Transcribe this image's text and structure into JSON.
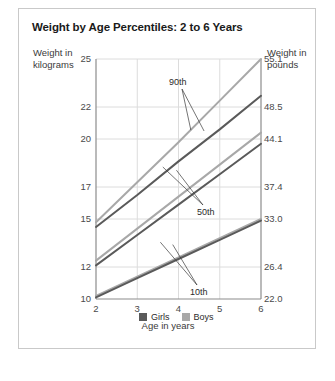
{
  "figure": {
    "title": "Weight by Age Percentiles: 2 to 6 Years",
    "y_left_title": "Weight in kilograms",
    "y_right_title": "Weight in pounds",
    "x_title": "Age in years",
    "border_color": "#c9c9c9",
    "grid_color": "#dcdcdc",
    "axis_color": "#8c8c8c"
  },
  "legend": {
    "items": [
      {
        "label": "Girls",
        "color": "#5a5a5a"
      },
      {
        "label": "Boys",
        "color": "#a8a8a8"
      }
    ]
  },
  "annotations": [
    {
      "name": "percentile-90-label",
      "text": "90th"
    },
    {
      "name": "percentile-50-label",
      "text": "50th"
    },
    {
      "name": "percentile-10-label",
      "text": "10th"
    }
  ],
  "chart_data": {
    "type": "line",
    "title": "Weight by Age Percentiles: 2 to 6 Years",
    "xlabel": "Age in years",
    "ylabel": "Weight in kilograms",
    "ylabel_right": "Weight in pounds",
    "grid": true,
    "legend_position": "bottom-center",
    "x": [
      2,
      3,
      4,
      5,
      6
    ],
    "xlim": [
      2,
      6
    ],
    "xticks": [
      "2",
      "3",
      "4",
      "5",
      "6"
    ],
    "ylim": [
      10,
      25
    ],
    "yticks_left": [
      "25",
      "22",
      "20",
      "17",
      "15",
      "12",
      "10"
    ],
    "yticks_left_values": [
      25,
      22,
      20,
      17,
      15,
      12,
      10
    ],
    "yticks_right": [
      "55.1",
      "48.5",
      "44.1",
      "37.4",
      "33.0",
      "26.4",
      "22.0"
    ],
    "yticks_right_values": [
      55.1,
      48.5,
      44.1,
      37.4,
      33.0,
      26.4,
      22.0
    ],
    "series": [
      {
        "name": "Boys 90th",
        "group": "Boys",
        "percentile": "90th",
        "color": "#a8a8a8",
        "values": [
          14.8,
          17.3,
          19.8,
          22.4,
          25.0
        ]
      },
      {
        "name": "Girls 90th",
        "group": "Girls",
        "percentile": "90th",
        "color": "#5a5a5a",
        "values": [
          14.5,
          16.5,
          18.6,
          20.6,
          22.7
        ]
      },
      {
        "name": "Boys 50th",
        "group": "Boys",
        "percentile": "50th",
        "color": "#a8a8a8",
        "values": [
          12.4,
          14.4,
          16.4,
          18.4,
          20.4
        ]
      },
      {
        "name": "Girls 50th",
        "group": "Girls",
        "percentile": "50th",
        "color": "#5a5a5a",
        "values": [
          12.1,
          14.0,
          15.9,
          17.8,
          19.7
        ]
      },
      {
        "name": "Boys 10th",
        "group": "Boys",
        "percentile": "10th",
        "color": "#a8a8a8",
        "values": [
          10.2,
          11.4,
          12.6,
          13.8,
          15.0
        ]
      },
      {
        "name": "Girls 10th",
        "group": "Girls",
        "percentile": "10th",
        "color": "#5a5a5a",
        "values": [
          10.1,
          11.3,
          12.5,
          13.7,
          14.9
        ]
      }
    ]
  }
}
